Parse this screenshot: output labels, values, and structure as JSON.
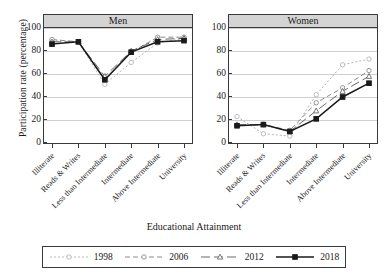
{
  "axes": {
    "ylabel": "Participation rate (percentage)",
    "xlabel": "Educational Attainment",
    "yticks": [
      "0",
      "20",
      "40",
      "60",
      "80",
      "100"
    ]
  },
  "panels": [
    {
      "title": "Men"
    },
    {
      "title": "Women"
    }
  ],
  "legend": {
    "items": [
      {
        "label": "1998",
        "color": "#b6b6b6",
        "dash": "2,2",
        "marker": "circle"
      },
      {
        "label": "2006",
        "color": "#8a8a8a",
        "dash": "5,3",
        "marker": "circle"
      },
      {
        "label": "2012",
        "color": "#6a6a6a",
        "dash": "9,4",
        "marker": "triangle"
      },
      {
        "label": "2018",
        "color": "#1a1a1a",
        "dash": "none",
        "marker": "square"
      }
    ]
  },
  "chart_data": {
    "type": "line",
    "xlabel": "Educational Attainment",
    "ylabel": "Participation rate (percentage)",
    "ylim": [
      0,
      100
    ],
    "yticks": [
      0,
      20,
      40,
      60,
      80,
      100
    ],
    "grid": true,
    "legend_position": "bottom",
    "categories": [
      "Illiterate",
      "Reads & Writes",
      "Less than Intermediate",
      "Intermediate",
      "Above Intermediate",
      "University"
    ],
    "panels": [
      {
        "name": "Men",
        "series": [
          {
            "name": "1998",
            "values": [
              89,
              88,
              51,
              70,
              87,
              91
            ]
          },
          {
            "name": "2006",
            "values": [
              90,
              88,
              55,
              79,
              92,
              92
            ]
          },
          {
            "name": "2012",
            "values": [
              88,
              88,
              58,
              80,
              90,
              91
            ]
          },
          {
            "name": "2018",
            "values": [
              86,
              88,
              55,
              79,
              88,
              89
            ]
          }
        ]
      },
      {
        "name": "Women",
        "series": [
          {
            "name": "1998",
            "values": [
              23,
              8,
              6,
              42,
              68,
              73
            ]
          },
          {
            "name": "2006",
            "values": [
              15,
              16,
              11,
              35,
              48,
              63
            ]
          },
          {
            "name": "2012",
            "values": [
              16,
              16,
              10,
              28,
              45,
              58
            ]
          },
          {
            "name": "2018",
            "values": [
              15,
              16,
              10,
              21,
              40,
              52
            ]
          }
        ]
      }
    ]
  }
}
